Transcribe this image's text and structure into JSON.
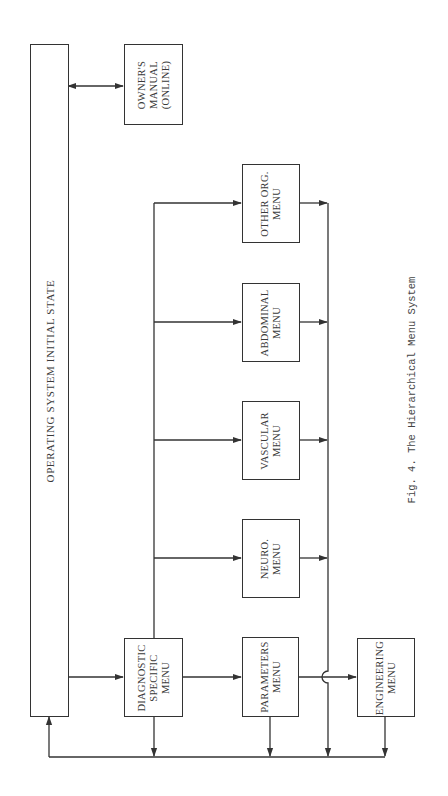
{
  "figure": {
    "caption": "Fig. 4.  The Hierarchical Menu System",
    "line_color": "#333333",
    "text_color": "#3a3a3a"
  },
  "nodes": {
    "initial_state": {
      "label": "OPERATING SYSTEM INITIAL STATE"
    },
    "owners_manual": {
      "lines": [
        "OWNER'S",
        "MANUAL",
        "(ONLINE)"
      ]
    },
    "diagnostic_specific": {
      "lines": [
        "DIAGNOSTIC",
        "SPECIFIC",
        "MENU"
      ]
    },
    "parameters": {
      "lines": [
        "PARAMETERS",
        "MENU"
      ]
    },
    "engineering": {
      "lines": [
        "ENGINEERING",
        "MENU"
      ]
    },
    "neuro": {
      "lines": [
        "NEURO.",
        "MENU"
      ]
    },
    "vascular": {
      "lines": [
        "VASCULAR",
        "MENU"
      ]
    },
    "abdominal": {
      "lines": [
        "ABDOMINAL",
        "MENU"
      ]
    },
    "other_org": {
      "lines": [
        "OTHER ORG.",
        "MENU"
      ]
    }
  },
  "edges": [
    {
      "from": "initial_state",
      "to": "owners_manual",
      "type": "bidirectional"
    },
    {
      "from": "initial_state",
      "to": "diagnostic_specific",
      "type": "directed"
    },
    {
      "from": "diagnostic_specific",
      "to": "parameters",
      "type": "directed"
    },
    {
      "from": "diagnostic_specific",
      "to": "neuro",
      "type": "directed"
    },
    {
      "from": "diagnostic_specific",
      "to": "vascular",
      "type": "directed"
    },
    {
      "from": "diagnostic_specific",
      "to": "abdominal",
      "type": "directed"
    },
    {
      "from": "diagnostic_specific",
      "to": "other_org",
      "type": "directed"
    },
    {
      "from": "parameters",
      "to": "engineering",
      "type": "directed"
    },
    {
      "from": "neuro",
      "to": "return_bus",
      "type": "directed"
    },
    {
      "from": "vascular",
      "to": "return_bus",
      "type": "directed"
    },
    {
      "from": "abdominal",
      "to": "return_bus",
      "type": "directed"
    },
    {
      "from": "other_org",
      "to": "return_bus",
      "type": "directed"
    },
    {
      "from": "diagnostic_specific",
      "to": "return_bus",
      "type": "directed"
    },
    {
      "from": "parameters",
      "to": "return_bus",
      "type": "directed"
    },
    {
      "from": "engineering",
      "to": "return_bus",
      "type": "directed"
    },
    {
      "from": "return_bus",
      "to": "initial_state",
      "type": "directed"
    }
  ]
}
